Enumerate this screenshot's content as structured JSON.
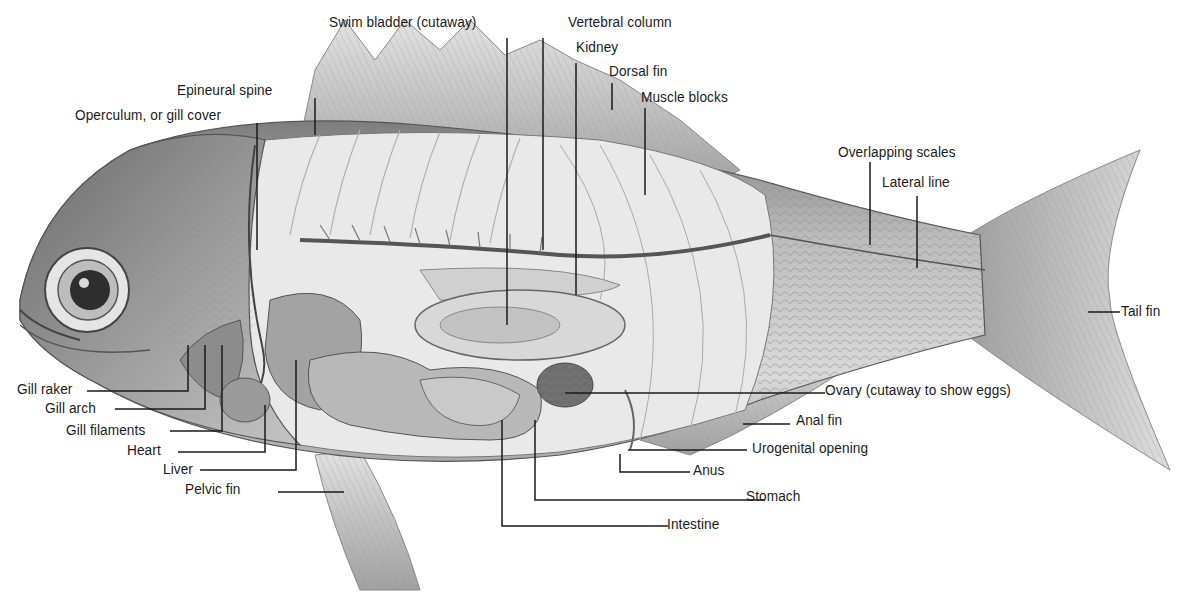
{
  "diagram": {
    "labels": [
      {
        "id": "swim-bladder",
        "text": "Swim bladder (cutaway)"
      },
      {
        "id": "vertebral-column",
        "text": "Vertebral column"
      },
      {
        "id": "kidney",
        "text": "Kidney"
      },
      {
        "id": "dorsal-fin",
        "text": "Dorsal fin"
      },
      {
        "id": "muscle-blocks",
        "text": "Muscle blocks"
      },
      {
        "id": "epineural-spine",
        "text": "Epineural spine"
      },
      {
        "id": "operculum",
        "text": "Operculum, or gill cover"
      },
      {
        "id": "overlapping-scales",
        "text": "Overlapping scales"
      },
      {
        "id": "lateral-line",
        "text": "Lateral line"
      },
      {
        "id": "tail-fin",
        "text": "Tail fin"
      },
      {
        "id": "gill-raker",
        "text": "Gill raker"
      },
      {
        "id": "gill-arch",
        "text": "Gill arch"
      },
      {
        "id": "gill-filaments",
        "text": "Gill filaments"
      },
      {
        "id": "heart",
        "text": "Heart"
      },
      {
        "id": "liver",
        "text": "Liver"
      },
      {
        "id": "pelvic-fin",
        "text": "Pelvic fin"
      },
      {
        "id": "ovary",
        "text": "Ovary (cutaway to show eggs)"
      },
      {
        "id": "anal-fin",
        "text": "Anal fin"
      },
      {
        "id": "urogenital-opening",
        "text": "Urogenital opening"
      },
      {
        "id": "anus",
        "text": "Anus"
      },
      {
        "id": "stomach",
        "text": "Stomach"
      },
      {
        "id": "intestine",
        "text": "Intestine"
      }
    ]
  }
}
